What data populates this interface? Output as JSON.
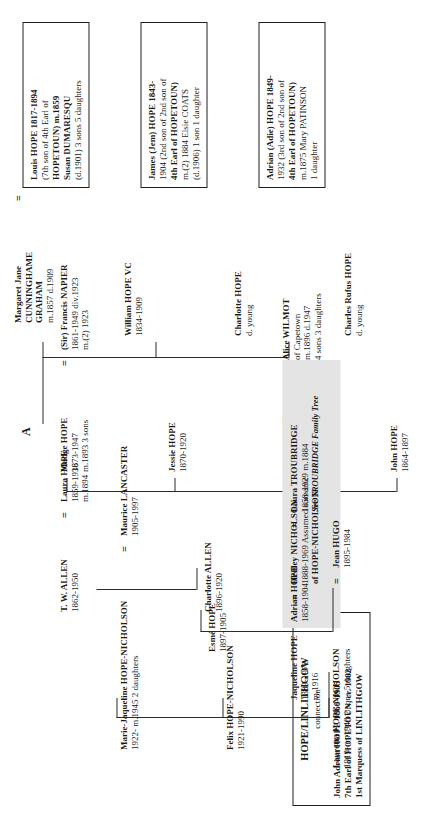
{
  "chart": {
    "orientation": "rotated-90-ccw",
    "connector_label": "A",
    "marriage_symbol": "=",
    "highlight_color": "#e4e4e4",
    "line_color": "#2b2b2b"
  },
  "boxes": [
    {
      "id": "louis-hope",
      "lines": [
        "Louis HOPE 1817-1894",
        "(7th son of 4th Earl of",
        "HOPETOUN) m.1859",
        "Susan DUMARESQU",
        "(d.1901) 3 sons  5 daughters"
      ],
      "bold_lines": [
        0,
        1,
        2,
        3,
        4
      ],
      "bold_map": [
        "Louis HOPE",
        "4th Earl of",
        "HOPETOUN",
        "Susan DUMARESQU",
        ""
      ]
    },
    {
      "id": "james-jem-hope",
      "lines": [
        "James (Jem) HOPE 1843-",
        "1904 (2nd son of 2nd son of",
        "4th Earl of HOPETOUN)",
        "m.(2) 1884 Elsie COATS",
        "(d.1906) 1 son  1 daughter"
      ]
    },
    {
      "id": "adrian-adie-hope",
      "lines": [
        "Adrian (Adie) HOPE 1849-",
        "1932 (3rd son of 2nd son of",
        "4th Earl of HOPETOUN)",
        "m.1875 Mary PATINSON",
        "1 daughter"
      ]
    },
    {
      "id": "hope-linlithgow-connection",
      "lines": [
        "HOPE/LINLITHGOW",
        "connection",
        "John Adrian HOPE  1860-1905",
        "7th Earl of HOPETOUN, cr. 1902",
        "1st Marquess of LINLITHGOW"
      ]
    }
  ],
  "people": [
    {
      "id": "margaret-jane-cunninghame-graham",
      "name": "Margaret Jane",
      "name2": "CUNNINGHAME",
      "name3": "GRAHAM",
      "detail": "m.1857  d.1909"
    },
    {
      "id": "william-hope-vc",
      "name": "William HOPE VC",
      "detail": "1834-1909"
    },
    {
      "id": "charlotte-hope",
      "name": "Charlotte HOPE",
      "detail": "d. young"
    },
    {
      "id": "charles-rufus-hope",
      "name": "Charles Rufus HOPE",
      "detail": "d. young"
    },
    {
      "id": "madge-hope",
      "name": "Madge HOPE",
      "detail": "1873-1947",
      "detail2": "m.1893  3 sons"
    },
    {
      "id": "francis-napier",
      "name": "(Sir) Francis NAPIER",
      "detail": "1861-1949 div.1923",
      "detail2": "m.(2) 1923"
    },
    {
      "id": "jessie-hope",
      "name": "Jessie HOPE",
      "detail": "1870-1920"
    },
    {
      "id": "charles-hope",
      "name": "Charles HOPE",
      "detail": "1867-1947"
    },
    {
      "id": "alice-wilmot",
      "name": "Alice WILMOT",
      "detail": "of Capetown",
      "detail2": "m.1896  d.1947",
      "detail3": "4 sons  3 daughters"
    },
    {
      "id": "john-hope",
      "name": "John HOPE",
      "detail": "1864-1897"
    },
    {
      "id": "tw-allen",
      "name": "T. W. ALLEN",
      "detail": "1862-1950"
    },
    {
      "id": "laura-hope",
      "name": "Laura HOPE",
      "detail": "1859-1936",
      "detail2": "m.1894"
    },
    {
      "id": "charlotte-allen",
      "name": "Charlotte ALLEN",
      "detail": "1896-1920"
    },
    {
      "id": "adrian-hope",
      "name": "Adrian HOPE",
      "detail": "1858-1904",
      "highlight": true
    },
    {
      "id": "laura-troubridge",
      "name": "Laura TROUBRIDGE",
      "detail": "1858-1929  m.1884",
      "detail2": "See TROUBRIDGE Family Tree",
      "highlight": true
    },
    {
      "id": "esme-hope",
      "name": "Esmé HOPE",
      "detail": "1897-1905"
    },
    {
      "id": "jaqueline-hope",
      "name": "Jaqueline HOPE",
      "detail": "1889-1972",
      "detail2": "m.1916"
    },
    {
      "id": "hedley-nicholson",
      "name": "Hedley NICHOLSON",
      "detail": "1888-1969 Assumed surname",
      "detail2": "of HOPE-NICHOLSON"
    },
    {
      "id": "marie-jaqueline-hope-nicholson",
      "name": "Marie-Jaqueline HOPE-NICHOLSON",
      "detail": "1922-  m.1945  2 daughters"
    },
    {
      "id": "felix-hope-nicholson",
      "name": "Felix HOPE-NICHOLSON",
      "detail": "1921-1990"
    },
    {
      "id": "lauretta-hope-nicholson",
      "name": "Lauretta HOPE-NICHOLSON",
      "detail": "1919-  m.1948  2 sons  5 daughters"
    },
    {
      "id": "jean-hugo",
      "name": "Jean HUGO",
      "detail": "1895-1984"
    },
    {
      "id": "maurice-lancaster",
      "name": "Maurice LANCASTER",
      "detail": "1905-1997"
    }
  ]
}
